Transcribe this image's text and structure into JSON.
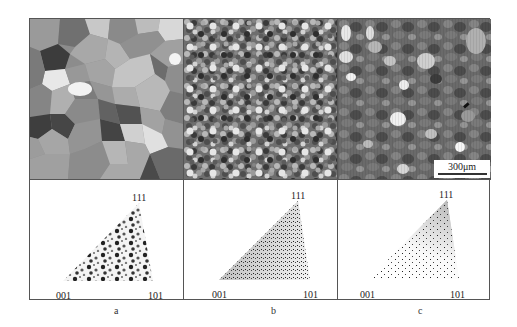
{
  "figure": {
    "panels": [
      {
        "id": "a",
        "label": "a",
        "micrograph": "coarse-grain EBSD orientation map",
        "ipf_labels": {
          "top": "111",
          "bottom_left": "001",
          "bottom_right": "101"
        },
        "ipf_distribution": "coarse clustered spots spread across triangle"
      },
      {
        "id": "b",
        "label": "b",
        "micrograph": "fine-grain EBSD orientation map",
        "ipf_labels": {
          "top": "111",
          "bottom_left": "001",
          "bottom_right": "101"
        },
        "ipf_distribution": "dense fine points, concentrated along 001-111 edge"
      },
      {
        "id": "c",
        "label": "c",
        "micrograph": "mixed-grain EBSD orientation map",
        "ipf_labels": {
          "top": "111",
          "bottom_left": "001",
          "bottom_right": "101"
        },
        "ipf_distribution": "sparse points, concentrated near 111"
      }
    ],
    "scale_bar": {
      "label": "300μm"
    },
    "colors": {
      "frame": "#555555",
      "background": "#ffffff",
      "ink": "#222222"
    }
  }
}
